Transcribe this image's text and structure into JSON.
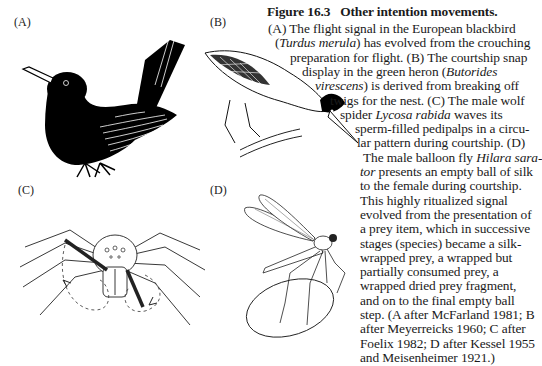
{
  "figure": {
    "number_label": "Figure 16.3",
    "title": "Other intention movements.",
    "panels": [
      {
        "label": "(A)",
        "subject": "European blackbird"
      },
      {
        "label": "(B)",
        "subject": "green heron"
      },
      {
        "label": "(C)",
        "subject": "male wolf spider"
      },
      {
        "label": "(D)",
        "subject": "male balloon fly with silk ball"
      }
    ],
    "caption_lines": [
      [
        {
          "t": "(A) The flight signal in the European blackbird"
        }
      ],
      [
        {
          "t": "("
        },
        {
          "t": "Turdus merula",
          "i": true
        },
        {
          "t": ") has evolved from the crouching"
        }
      ],
      [
        {
          "t": "preparation for flight. (B) The courtship snap"
        }
      ],
      [
        {
          "t": "display in the green heron ("
        },
        {
          "t": "Butorides",
          "i": true
        }
      ],
      [
        {
          "t": "virescens",
          "i": true
        },
        {
          "t": ") is derived from breaking off"
        }
      ],
      [
        {
          "t": "twigs for the nest. (C) The male wolf"
        }
      ],
      [
        {
          "t": "spider "
        },
        {
          "t": "Lycosa rabida",
          "i": true
        },
        {
          "t": " waves its"
        }
      ],
      [
        {
          "t": "sperm-filled pedipalps in a circu-"
        }
      ],
      [
        {
          "t": "lar pattern during courtship. (D)"
        }
      ],
      [
        {
          "t": "The male balloon fly "
        },
        {
          "t": "Hilara sara-",
          "i": true
        }
      ],
      [
        {
          "t": "tor",
          "i": true
        },
        {
          "t": " presents an empty ball of silk"
        }
      ],
      [
        {
          "t": "to the female during courtship."
        }
      ],
      [
        {
          "t": "This highly ritualized signal"
        }
      ],
      [
        {
          "t": "evolved from the presentation of"
        }
      ],
      [
        {
          "t": "a prey item, which in successive"
        }
      ],
      [
        {
          "t": "stages (species) became a silk-"
        }
      ],
      [
        {
          "t": "wrapped prey, a wrapped but"
        }
      ],
      [
        {
          "t": "partially consumed prey, a"
        }
      ],
      [
        {
          "t": "wrapped dried prey fragment,"
        }
      ],
      [
        {
          "t": "and on to the final empty ball"
        }
      ],
      [
        {
          "t": "step. (A after McFarland 1981; B"
        }
      ],
      [
        {
          "t": "after Meyerreicks 1960; C after"
        }
      ],
      [
        {
          "t": "Foelix 1982; D after Kessel 1955"
        }
      ],
      [
        {
          "t": "and Meisenheimer 1921.)"
        }
      ]
    ]
  }
}
